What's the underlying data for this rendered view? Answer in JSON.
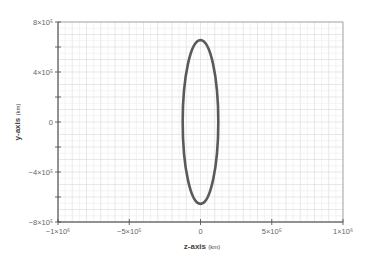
{
  "chart_data": {
    "type": "line",
    "title": "",
    "xlabel": "z-axis",
    "xlabel_unit": "(km)",
    "ylabel": "y-axis",
    "ylabel_unit": "(km)",
    "xlim": [
      -1000000,
      1000000
    ],
    "ylim": [
      -800000,
      800000
    ],
    "grid": true,
    "legend": null,
    "x_ticks": [
      {
        "value": -1000000,
        "label": "−1×10⁶"
      },
      {
        "value": -500000,
        "label": "−5×10⁵"
      },
      {
        "value": 0,
        "label": "0"
      },
      {
        "value": 500000,
        "label": "5×10⁵"
      },
      {
        "value": 1000000,
        "label": "1×10⁶"
      }
    ],
    "y_ticks": [
      {
        "value": 800000,
        "label": "8×10⁵"
      },
      {
        "value": 400000,
        "label": "4×10⁵"
      },
      {
        "value": 0,
        "label": "0"
      },
      {
        "value": -400000,
        "label": "−4×10⁵"
      },
      {
        "value": -800000,
        "label": "−8×10⁵"
      }
    ],
    "series": [
      {
        "name": "orbit",
        "shape": "ellipse",
        "center": {
          "z": 0,
          "y": 0
        },
        "semi_axis_z": 125000,
        "semi_axis_y": 655000,
        "color": "#5a5a5a"
      }
    ]
  },
  "colors": {
    "axis": "#555555",
    "grid_major": "#d9d9d9",
    "grid_minor": "#ececec",
    "curve": "#5a5a5a"
  }
}
